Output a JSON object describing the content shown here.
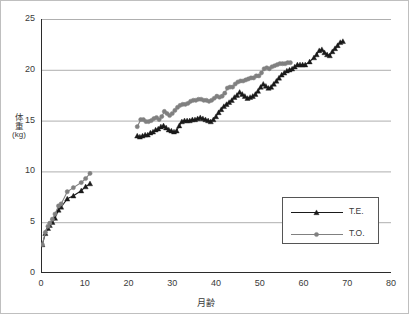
{
  "chart_data": {
    "type": "line",
    "title": "",
    "xlabel": "月齢",
    "ylabel": "体重(kg)",
    "ylabel_chars": [
      "体",
      "重"
    ],
    "ylabel_unit": "(kg)",
    "xlim": [
      0,
      80
    ],
    "ylim": [
      0,
      25
    ],
    "xticks": [
      0,
      10,
      20,
      30,
      40,
      50,
      60,
      70,
      80
    ],
    "yticks": [
      0,
      5,
      10,
      15,
      20,
      25
    ],
    "xtick_labels": [
      "0",
      "10",
      "20",
      "30",
      "40",
      "50",
      "60",
      "70",
      "80"
    ],
    "ytick_labels": [
      "0",
      "5",
      "10",
      "15",
      "20",
      "25"
    ],
    "x_minor_tick_step": 5,
    "grid": "horizontal",
    "legend_position": "lower-right",
    "series": [
      {
        "name": "T.E.",
        "color": "#1a1a1a",
        "marker": "triangle",
        "segments": [
          {
            "x": [
              0.3,
              1.0,
              1.6,
              2.0,
              2.6,
              3.2,
              4.0,
              4.6,
              6.0,
              7.4,
              9.2,
              10.2,
              11.2
            ],
            "y": [
              2.8,
              3.9,
              4.4,
              4.7,
              5.0,
              5.4,
              6.2,
              6.5,
              7.3,
              7.6,
              8.1,
              8.5,
              8.8
            ]
          },
          {
            "x": [
              22.0,
              22.6,
              23.2,
              23.8,
              24.4,
              25.0,
              25.6,
              26.2,
              26.8,
              27.4,
              28.0,
              28.6,
              29.2,
              29.8,
              30.4,
              31.0,
              31.6,
              32.2,
              32.8,
              33.4,
              34.0,
              34.6,
              35.2,
              35.8,
              36.4,
              37.0,
              37.6,
              38.2,
              38.8,
              39.4,
              40.0,
              40.6,
              41.2,
              41.8,
              42.4,
              43.0,
              43.6,
              44.2,
              44.8,
              45.4,
              46.0,
              46.6,
              47.2,
              47.8,
              48.4,
              49.0,
              49.6,
              50.2,
              50.8,
              51.4,
              52.0,
              52.6,
              53.2,
              53.8,
              54.4,
              55.0,
              55.6,
              56.2,
              56.8,
              57.4,
              58.0,
              58.6,
              59.2,
              59.8,
              60.4,
              61.4,
              62.4,
              63.0,
              63.6,
              64.2,
              64.8,
              65.4,
              66.0,
              66.6,
              67.2,
              67.8,
              68.4,
              69.0
            ],
            "y": [
              13.5,
              13.4,
              13.5,
              13.6,
              13.6,
              13.8,
              13.9,
              14.1,
              14.2,
              14.4,
              14.5,
              14.3,
              14.1,
              14.0,
              13.9,
              14.0,
              14.5,
              14.9,
              15.0,
              15.0,
              15.0,
              15.1,
              15.1,
              15.2,
              15.3,
              15.2,
              15.1,
              15.0,
              14.9,
              15.1,
              15.4,
              15.8,
              16.1,
              16.4,
              16.6,
              16.8,
              17.0,
              17.3,
              17.5,
              17.8,
              17.6,
              17.4,
              17.2,
              17.3,
              17.4,
              17.6,
              17.9,
              18.3,
              18.6,
              18.4,
              18.2,
              18.3,
              18.6,
              18.9,
              19.2,
              19.5,
              19.7,
              19.9,
              20.0,
              20.1,
              20.3,
              20.5,
              20.5,
              20.5,
              20.5,
              20.8,
              21.2,
              21.5,
              21.9,
              22.0,
              21.7,
              21.5,
              21.4,
              21.8,
              22.1,
              22.4,
              22.7,
              22.8
            ]
          }
        ]
      },
      {
        "name": "T.O.",
        "color": "#808080",
        "marker": "circle",
        "segments": [
          {
            "x": [
              0.3,
              1.0,
              1.6,
              2.0,
              2.6,
              3.2,
              4.0,
              4.6,
              6.0,
              7.4,
              9.2,
              10.2,
              11.2
            ],
            "y": [
              2.8,
              4.0,
              4.6,
              4.9,
              5.3,
              5.8,
              6.6,
              6.8,
              8.0,
              8.4,
              8.9,
              9.3,
              9.8
            ]
          },
          {
            "x": [
              22.0,
              22.8,
              23.4,
              24.0,
              24.6,
              25.2,
              25.8,
              26.4,
              27.0,
              27.6,
              28.2,
              28.8,
              29.4,
              30.0,
              30.6,
              31.2,
              31.8,
              32.4,
              33.0,
              33.6,
              34.2,
              34.8,
              35.4,
              36.0,
              36.6,
              37.2,
              37.8,
              38.4,
              39.0,
              39.6,
              40.2,
              40.8,
              41.4,
              42.0,
              42.6,
              43.2,
              43.8,
              44.4,
              45.0,
              45.6,
              46.2,
              46.8,
              47.4,
              48.0,
              48.6,
              49.2,
              49.8,
              50.4,
              51.0,
              51.6,
              52.2,
              52.8,
              53.4,
              54.0,
              54.6,
              55.2,
              55.8,
              56.4,
              57.0
            ],
            "y": [
              14.4,
              15.1,
              15.1,
              14.9,
              14.9,
              15.0,
              15.2,
              15.3,
              15.1,
              15.4,
              15.9,
              15.7,
              15.5,
              15.7,
              16.0,
              16.3,
              16.5,
              16.6,
              16.6,
              16.7,
              16.9,
              17.0,
              17.0,
              17.1,
              17.1,
              17.0,
              17.0,
              16.9,
              17.0,
              17.2,
              17.4,
              17.3,
              17.4,
              17.7,
              18.2,
              18.3,
              18.3,
              18.6,
              18.8,
              18.9,
              18.9,
              19.0,
              19.1,
              19.2,
              19.2,
              19.4,
              19.4,
              19.7,
              20.1,
              20.2,
              20.1,
              20.3,
              20.4,
              20.5,
              20.6,
              20.6,
              20.6,
              20.7,
              20.7
            ]
          }
        ]
      }
    ]
  },
  "legend": {
    "entries": [
      {
        "label": "T.E."
      },
      {
        "label": "T.O."
      }
    ]
  }
}
